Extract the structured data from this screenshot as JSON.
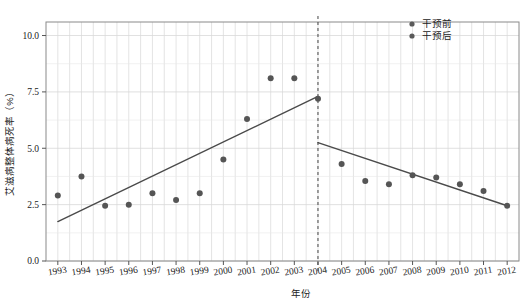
{
  "chart_data": {
    "type": "scatter",
    "title": "",
    "xlabel": "年份",
    "ylabel": "艾滋病整体病死率（%）",
    "xlim": [
      1992.5,
      2012.5
    ],
    "ylim": [
      0.0,
      10.6
    ],
    "grid": true,
    "legend_position": "top-right",
    "x": [
      1993,
      1994,
      1995,
      1996,
      1997,
      1998,
      1999,
      2000,
      2001,
      2002,
      2003,
      2004,
      2005,
      2006,
      2007,
      2008,
      2009,
      2010,
      2011,
      2012
    ],
    "series": [
      {
        "name": "干预前",
        "color": "#555555",
        "x": [
          1993,
          1994,
          1995,
          1996,
          1997,
          1998,
          1999,
          2000,
          2001,
          2002,
          2003,
          2004
        ],
        "values": [
          2.9,
          3.75,
          2.45,
          2.5,
          3.0,
          2.7,
          3.0,
          4.5,
          6.3,
          8.1,
          8.1,
          7.2
        ]
      },
      {
        "name": "干预后",
        "color": "#555555",
        "x": [
          2005,
          2006,
          2007,
          2008,
          2009,
          2010,
          2011,
          2012
        ],
        "values": [
          4.3,
          3.55,
          3.4,
          3.8,
          3.7,
          3.4,
          3.1,
          2.45
        ]
      }
    ],
    "trend_lines": [
      {
        "name": "干预前趋势线",
        "x0": 1993,
        "y0": 1.75,
        "x1": 2004,
        "y1": 7.3
      },
      {
        "name": "干预后趋势线",
        "x0": 2004,
        "y0": 5.25,
        "x1": 2012,
        "y1": 2.45
      }
    ],
    "intervention_marker": {
      "label": "",
      "x": 2004,
      "style": "dashed"
    },
    "yticks": [
      0.0,
      2.5,
      5.0,
      7.5,
      10.0
    ],
    "ytick_labels": [
      "0.0",
      "2.5",
      "5.0",
      "7.5",
      "10.0"
    ],
    "xticks": [
      1993,
      1994,
      1995,
      1996,
      1997,
      1998,
      1999,
      2000,
      2001,
      2002,
      2003,
      2004,
      2005,
      2006,
      2007,
      2008,
      2009,
      2010,
      2011,
      2012
    ],
    "xtick_labels": [
      "1993",
      "1994",
      "1995",
      "1996",
      "1997",
      "1998",
      "1999",
      "2000",
      "2001",
      "2002",
      "2003",
      "2004",
      "2005",
      "2006",
      "2007",
      "2008",
      "2009",
      "2010",
      "2011",
      "2012"
    ],
    "minor_y": [
      1.25,
      3.75,
      6.25,
      8.75
    ]
  },
  "legend": {
    "items": [
      {
        "label": "干预前"
      },
      {
        "label": "干预后"
      }
    ]
  },
  "colors": {
    "point": "#5a5a5a",
    "trend": "#4a4a4a",
    "grid": "#d8d8d8",
    "axis": "#8a8a8a",
    "background": "#ffffff"
  }
}
